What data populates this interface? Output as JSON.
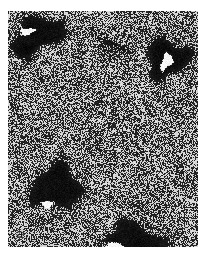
{
  "figure": {
    "domain": "micrograph",
    "canvas": {
      "width": 208,
      "height": 259,
      "background": "#ffffff"
    },
    "panel": {
      "label": "a",
      "label_color": "#141414",
      "label_x": 16,
      "label_y": 227,
      "label_size": 13,
      "x": 8,
      "y": 11,
      "width": 190,
      "height": 236,
      "description": "grainy high-contrast monochrome electron micrograph with dark aggregate blobs"
    },
    "texture": {
      "type": "salt-and-pepper-grain",
      "speckle_size_px": 1,
      "mean_gray": 118,
      "contrast": 0.92,
      "dark_value": "#0a0a0a",
      "light_value": "#f2f2f2",
      "seed": 20240417
    },
    "features": [
      {
        "name": "dark-blob-top-left",
        "shape": "angular-cluster",
        "cx": 38,
        "cy": 34,
        "rx": 30,
        "ry": 15,
        "rotation": -18,
        "darkness": 0.95
      },
      {
        "name": "dark-blob-top-right",
        "shape": "rounded-cluster",
        "cx": 166,
        "cy": 58,
        "rx": 22,
        "ry": 19,
        "rotation": 14,
        "darkness": 0.97
      },
      {
        "name": "dark-blob-left-center",
        "shape": "large-irregular",
        "cx": 56,
        "cy": 187,
        "rx": 26,
        "ry": 22,
        "rotation": -6,
        "darkness": 0.98
      },
      {
        "name": "dark-blob-bottom-center",
        "shape": "wide-irregular",
        "cx": 133,
        "cy": 241,
        "rx": 32,
        "ry": 17,
        "rotation": 8,
        "darkness": 0.96
      },
      {
        "name": "dark-smudge-upper-middle",
        "shape": "faint-cluster",
        "cx": 110,
        "cy": 47,
        "rx": 17,
        "ry": 10,
        "rotation": 22,
        "darkness": 0.45
      },
      {
        "name": "dark-smudge-upper-left-tail",
        "shape": "faint-cluster",
        "cx": 24,
        "cy": 52,
        "rx": 14,
        "ry": 9,
        "rotation": 30,
        "darkness": 0.38
      }
    ],
    "highlights": [
      {
        "name": "bright-streak-top-left",
        "cx": 27,
        "cy": 31,
        "rx": 8,
        "ry": 3.5,
        "rotation": -12,
        "brightness": 1.0
      },
      {
        "name": "bright-crescent-top-right",
        "cx": 166,
        "cy": 61,
        "rx": 5,
        "ry": 10,
        "rotation": 28,
        "brightness": 1.0
      },
      {
        "name": "bright-spot-left-center",
        "cx": 47,
        "cy": 204,
        "rx": 5,
        "ry": 4,
        "rotation": 0,
        "brightness": 1.0
      },
      {
        "name": "bright-streak-bottom-center",
        "cx": 113,
        "cy": 246,
        "rx": 10,
        "ry": 4,
        "rotation": -6,
        "brightness": 1.0
      }
    ]
  }
}
